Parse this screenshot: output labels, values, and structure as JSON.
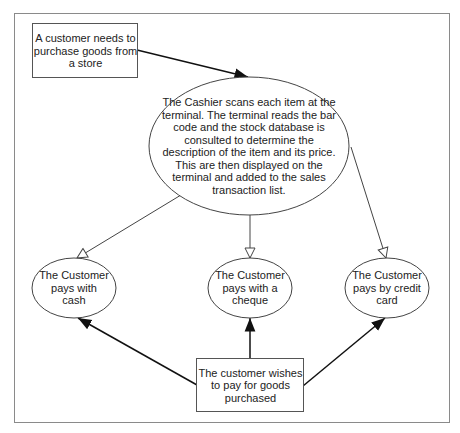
{
  "diagram": {
    "type": "flow",
    "nodes": {
      "start": {
        "shape": "rectangle",
        "label": "A customer needs to\npurchase goods from\na store"
      },
      "scan": {
        "shape": "ellipse",
        "label": "The Cashier scans each item at the\nterminal. The terminal reads the bar\ncode and the stock database is\nconsulted to determine the\ndescription of the item and its price.\nThis are then displayed on the\nterminal and added to the sales\ntransaction list."
      },
      "cash": {
        "shape": "ellipse",
        "label": "The Customer\npays with\ncash"
      },
      "cheque": {
        "shape": "ellipse",
        "label": "The Customer\npays with a\ncheque"
      },
      "credit": {
        "shape": "ellipse",
        "label": "The Customer\npays by credit\ncard"
      },
      "wish": {
        "shape": "rectangle",
        "label": "The customer wishes\nto pay for goods\npurchased"
      }
    },
    "edges": [
      {
        "from": "start",
        "to": "scan",
        "arrow": "filled"
      },
      {
        "from": "scan",
        "to": "cash",
        "arrow": "hollow"
      },
      {
        "from": "scan",
        "to": "cheque",
        "arrow": "hollow"
      },
      {
        "from": "scan",
        "to": "credit",
        "arrow": "hollow"
      },
      {
        "from": "wish",
        "to": "cash",
        "arrow": "filled"
      },
      {
        "from": "wish",
        "to": "cheque",
        "arrow": "filled"
      },
      {
        "from": "wish",
        "to": "credit",
        "arrow": "filled"
      }
    ],
    "colors": {
      "frame": "#8a8a8a",
      "stroke": "#333333",
      "background": "#ffffff"
    }
  }
}
